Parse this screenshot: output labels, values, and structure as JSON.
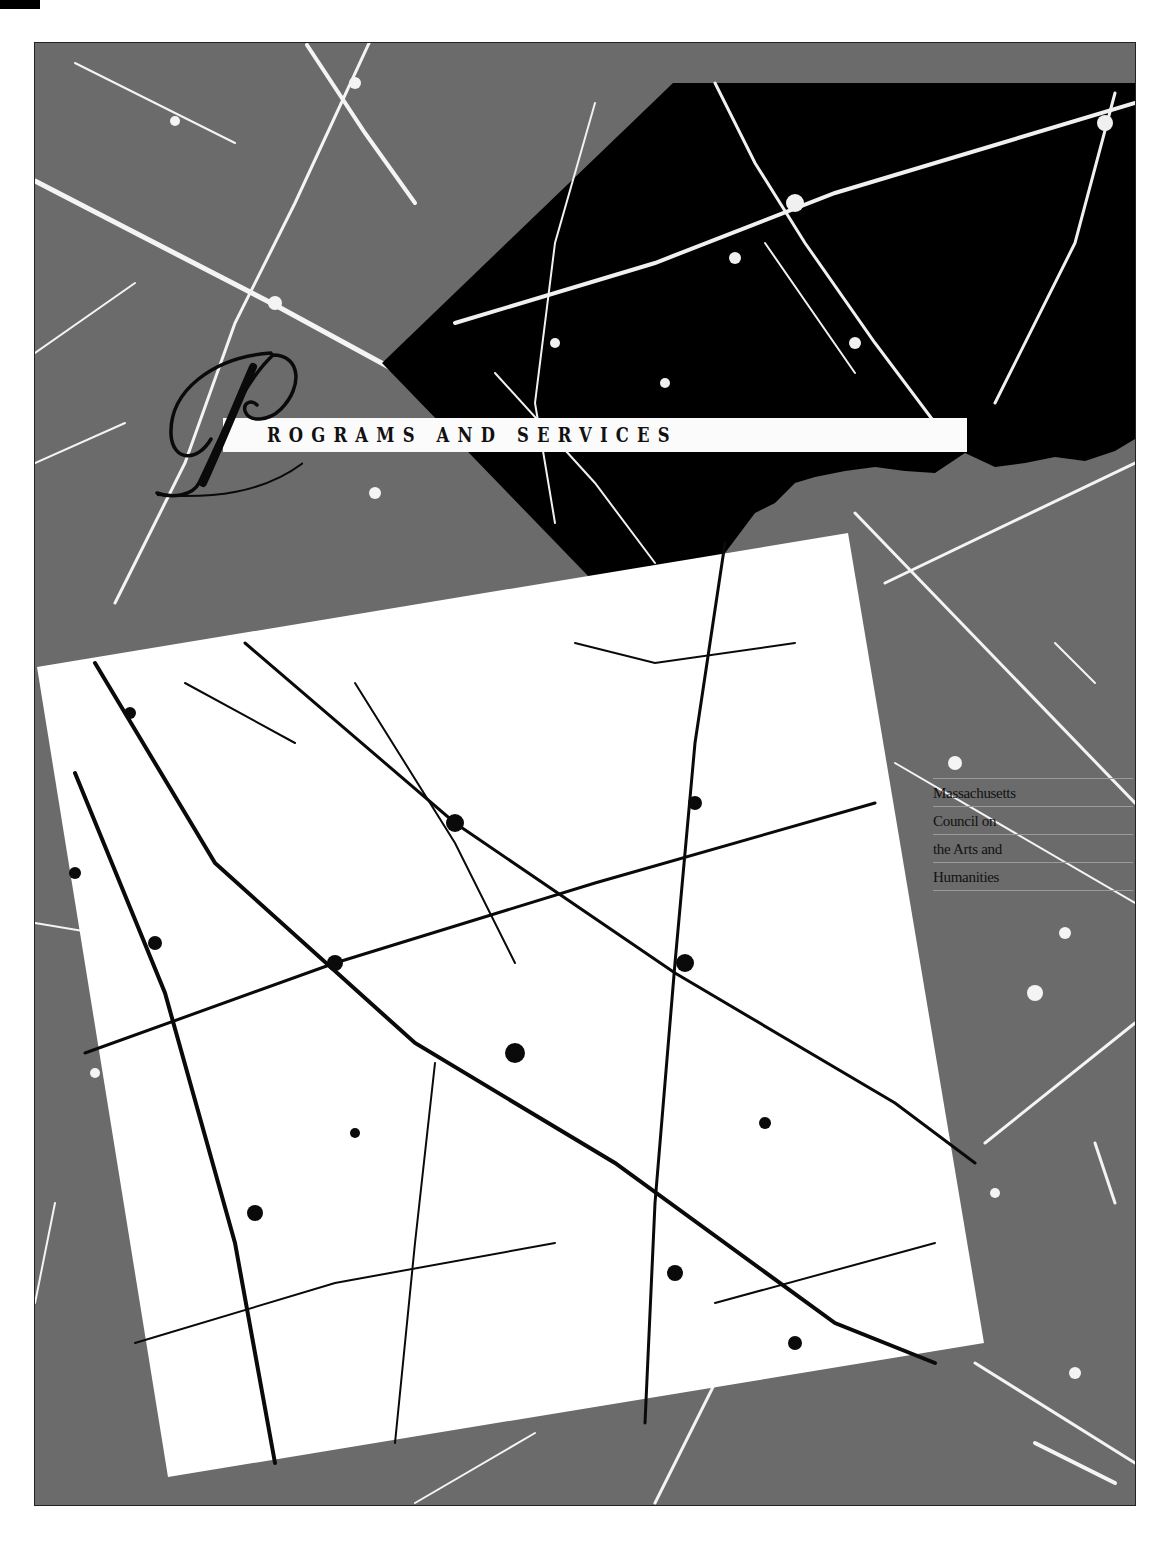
{
  "page": {
    "title_drop_cap": "P",
    "title_rest": "ROGRAMS AND SERVICES",
    "title_full": "Programs and Services"
  },
  "organization": {
    "lines": [
      "Massachusetts",
      "Council on",
      "the Arts and",
      "Humanities"
    ]
  },
  "colors": {
    "background_gray": "#6b6b6b",
    "dark_panel": "#000000",
    "light_panel": "#ffffff",
    "title_bar": "#fbfbfb",
    "text": "#111111"
  },
  "artwork": {
    "description": "cracked marble texture with three overlapping panels: gray field, black rotated panel, white rotated square"
  }
}
